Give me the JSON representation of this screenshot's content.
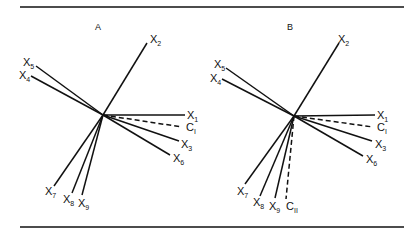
{
  "panels": [
    {
      "title": "A",
      "center": [
        103,
        115
      ],
      "vectors": [
        {
          "name": "X",
          "sub": "1",
          "end": [
            185,
            115
          ],
          "label": [
            187,
            119
          ],
          "dashed": false
        },
        {
          "name": "X",
          "sub": "2",
          "end": [
            147,
            43
          ],
          "label": [
            150,
            43
          ],
          "dashed": false
        },
        {
          "name": "X",
          "sub": "3",
          "end": [
            179,
            141
          ],
          "label": [
            181,
            148
          ],
          "dashed": false
        },
        {
          "name": "X",
          "sub": "4",
          "end": [
            31,
            76
          ],
          "label": [
            19,
            79
          ],
          "dashed": false
        },
        {
          "name": "X",
          "sub": "5",
          "end": [
            36,
            66
          ],
          "label": [
            23,
            66
          ],
          "dashed": false
        },
        {
          "name": "X",
          "sub": "6",
          "end": [
            170,
            155
          ],
          "label": [
            173,
            162
          ],
          "dashed": false
        },
        {
          "name": "X",
          "sub": "7",
          "end": [
            54,
            186
          ],
          "label": [
            45,
            195
          ],
          "dashed": false
        },
        {
          "name": "X",
          "sub": "8",
          "end": [
            72,
            193
          ],
          "label": [
            63,
            203
          ],
          "dashed": false
        },
        {
          "name": "X",
          "sub": "9",
          "end": [
            82,
            195
          ],
          "label": [
            78,
            207
          ],
          "dashed": false
        },
        {
          "name": "C",
          "sub": "I",
          "end": [
            182,
            127
          ],
          "label": [
            186,
            131
          ],
          "dashed": true
        }
      ]
    },
    {
      "title": "B",
      "center": [
        294,
        116
      ],
      "vectors": [
        {
          "name": "X",
          "sub": "1",
          "end": [
            375,
            115
          ],
          "label": [
            377,
            119
          ],
          "dashed": false
        },
        {
          "name": "X",
          "sub": "2",
          "end": [
            339,
            43
          ],
          "label": [
            338,
            43
          ],
          "dashed": false
        },
        {
          "name": "X",
          "sub": "3",
          "end": [
            372,
            141
          ],
          "label": [
            375,
            148
          ],
          "dashed": false
        },
        {
          "name": "X",
          "sub": "4",
          "end": [
            222,
            79
          ],
          "label": [
            210,
            82
          ],
          "dashed": false
        },
        {
          "name": "X",
          "sub": "5",
          "end": [
            226,
            68
          ],
          "label": [
            214,
            68
          ],
          "dashed": false
        },
        {
          "name": "X",
          "sub": "6",
          "end": [
            363,
            156
          ],
          "label": [
            366,
            163
          ],
          "dashed": false
        },
        {
          "name": "X",
          "sub": "7",
          "end": [
            245,
            184
          ],
          "label": [
            237,
            195
          ],
          "dashed": false
        },
        {
          "name": "X",
          "sub": "8",
          "end": [
            260,
            196
          ],
          "label": [
            253,
            206
          ],
          "dashed": false
        },
        {
          "name": "X",
          "sub": "9",
          "end": [
            275,
            198
          ],
          "label": [
            269,
            210
          ],
          "dashed": false
        },
        {
          "name": "C",
          "sub": "I",
          "end": [
            373,
            127
          ],
          "label": [
            377,
            131
          ],
          "dashed": true
        },
        {
          "name": "C",
          "sub": "II",
          "end": [
            286,
            199
          ],
          "label": [
            286,
            210
          ],
          "dashed": true
        }
      ]
    }
  ],
  "rules": {
    "top_y": 7,
    "bottom_y": 227,
    "x1": 20,
    "x2": 404
  }
}
